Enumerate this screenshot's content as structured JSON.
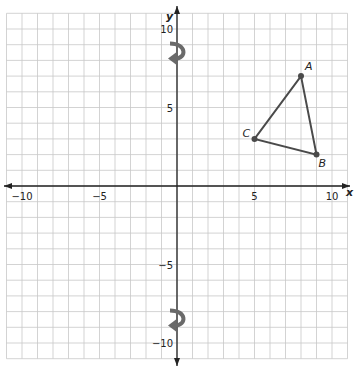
{
  "chart_data": {
    "type": "scatter",
    "title": "",
    "xlabel": "x",
    "ylabel": "y",
    "xlim": [
      -11,
      11
    ],
    "ylim": [
      -11,
      11
    ],
    "grid": true,
    "x_ticks": [
      {
        "value": -10,
        "label": "−10"
      },
      {
        "value": -5,
        "label": "−5"
      },
      {
        "value": 5,
        "label": "5"
      },
      {
        "value": 10,
        "label": "10"
      }
    ],
    "y_ticks": [
      {
        "value": 10,
        "label": "10"
      },
      {
        "value": 5,
        "label": "5"
      },
      {
        "value": -5,
        "label": "−5"
      },
      {
        "value": -10,
        "label": "−10"
      }
    ],
    "points": [
      {
        "label": "A",
        "x": 8,
        "y": 7
      },
      {
        "label": "B",
        "x": 9,
        "y": 2
      },
      {
        "label": "C",
        "x": 5,
        "y": 3
      }
    ],
    "polygon": [
      "A",
      "B",
      "C"
    ],
    "annotations": [
      {
        "type": "rotation-arrow",
        "near": [
          0,
          8.5
        ]
      },
      {
        "type": "rotation-arrow",
        "near": [
          0,
          -8.5
        ]
      }
    ],
    "colors": {
      "grid": "#c8c8c8",
      "axis": "#222222",
      "triangle": "#4a4a4a",
      "arrow": "#6a6a6a"
    }
  }
}
